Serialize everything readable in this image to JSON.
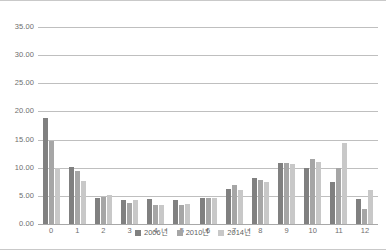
{
  "chart_data": {
    "type": "bar",
    "title": "",
    "subtitle": "",
    "xlabel": "",
    "ylabel": "",
    "ylim": [
      0,
      35
    ],
    "ytick_step": 5,
    "grid": true,
    "legend_position": "bottom",
    "categories": [
      "0",
      "1",
      "2",
      "3",
      "4",
      "5",
      "6",
      "7",
      "8",
      "9",
      "10",
      "11",
      "12"
    ],
    "ytick_labels": [
      "35.00",
      "30.00",
      "25.00",
      "20.00",
      "15.00",
      "10.00",
      "5.00",
      "0.00"
    ],
    "ytick_values": [
      35,
      30,
      25,
      20,
      15,
      10,
      5,
      0
    ],
    "series": [
      {
        "name": "2006년",
        "color": "#808080",
        "values": [
          18.8,
          10.1,
          4.6,
          4.3,
          4.4,
          4.2,
          4.7,
          6.2,
          8.1,
          10.9,
          9.9,
          7.5,
          4.5
        ]
      },
      {
        "name": "2010년",
        "color": "#a6a6a6",
        "values": [
          14.8,
          9.4,
          4.8,
          3.8,
          3.3,
          3.4,
          4.7,
          7.0,
          7.8,
          10.9,
          11.5,
          9.9,
          2.6
        ]
      },
      {
        "name": "2014년",
        "color": "#c8c8c8",
        "values": [
          10.0,
          7.6,
          5.1,
          4.3,
          3.3,
          3.6,
          4.6,
          6.0,
          7.4,
          10.6,
          11.0,
          14.4,
          6.1
        ]
      }
    ]
  },
  "legend": {
    "items": [
      {
        "label": "2006년"
      },
      {
        "label": "2010년"
      },
      {
        "label": "2014년"
      }
    ]
  }
}
